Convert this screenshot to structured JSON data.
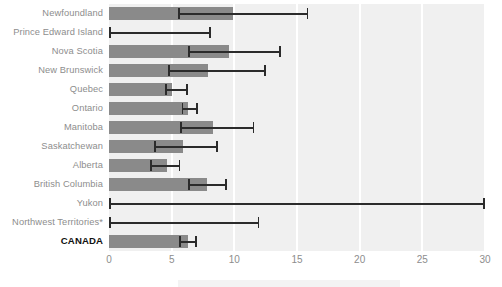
{
  "chart_data": {
    "type": "bar",
    "orientation": "horizontal",
    "title": "",
    "subtitle": "",
    "xlabel": "",
    "ylabel": "",
    "xlim": [
      0,
      30
    ],
    "ylim": null,
    "grid": true,
    "gridlines": "vertical white gridlines at every x tick",
    "legend": null,
    "legend_position": "none",
    "error_bars": "horizontal confidence intervals drawn per category",
    "tick_labels": [
      "0",
      "5",
      "10",
      "15",
      "20",
      "25",
      "30"
    ],
    "tick_values": [
      0,
      5,
      10,
      15,
      20,
      25,
      30
    ],
    "categories": [
      "Newfoundland",
      "Prince Edward Island",
      "Nova Scotia",
      "New Brunswick",
      "Quebec",
      "Ontario",
      "Manitoba",
      "Saskatchewan",
      "Alberta",
      "British Columbia",
      "Yukon",
      "Northwest Territories*",
      "CANADA"
    ],
    "values": [
      9.9,
      0.0,
      9.6,
      7.9,
      5.0,
      6.3,
      8.3,
      5.9,
      4.6,
      7.8,
      0.0,
      0.0,
      6.3
    ],
    "ci_low": [
      5.5,
      0.0,
      6.3,
      4.7,
      4.5,
      5.8,
      5.7,
      3.6,
      3.3,
      6.3,
      0.0,
      0.0,
      5.6
    ],
    "ci_high": [
      15.9,
      8.1,
      13.7,
      12.5,
      6.3,
      7.1,
      11.6,
      8.7,
      5.7,
      9.4,
      30.0,
      12.0,
      7.0
    ],
    "emphasis_index": 12,
    "footnote_marker": "*",
    "colors": {
      "bar": "#8a8a8a",
      "error_bar": "#2b2b2b",
      "plot_background": "#f0f0f0",
      "gridline": "#ffffff",
      "label_text": "#8d8d8d",
      "emphasis_text": "#111111",
      "page_background": "#ffffff"
    }
  }
}
